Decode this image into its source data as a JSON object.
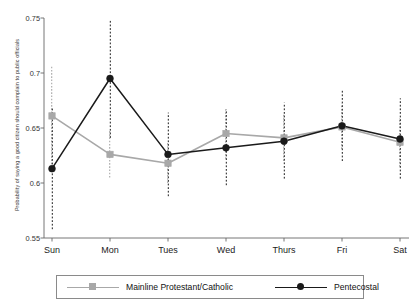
{
  "chart_data": {
    "type": "line",
    "title": "",
    "subtitle": "",
    "xlabel": "",
    "ylabel": "Probability of saying a good citizen should complain to public officials",
    "categories": [
      "Sun",
      "Mon",
      "Tues",
      "Wed",
      "Thurs",
      "Fri",
      "Sat"
    ],
    "ylim": [
      0.55,
      0.75
    ],
    "yticks": [
      0.75,
      0.7,
      0.65,
      0.6,
      0.55
    ],
    "ytick_labels": [
      "0.75",
      "0.7",
      "0.65",
      "0.6",
      "0.55"
    ],
    "grid": false,
    "legend_position": "bottom",
    "errorbars": true,
    "errorbar_style": "dotted-vertical",
    "series": [
      {
        "name": "Mainline Protestant/Catholic",
        "color": "#a8a8a8",
        "marker": "square",
        "values": [
          0.661,
          0.626,
          0.618,
          0.645,
          0.641,
          0.651,
          0.637
        ],
        "ci_low": [
          0.617,
          0.605,
          0.6,
          0.622,
          0.62,
          0.631,
          0.615
        ],
        "ci_high": [
          0.706,
          0.648,
          0.637,
          0.668,
          0.662,
          0.672,
          0.659
        ]
      },
      {
        "name": "Pentecostal",
        "color": "#1a1a1a",
        "marker": "circle",
        "values": [
          0.613,
          0.695,
          0.626,
          0.632,
          0.638,
          0.652,
          0.64
        ],
        "ci_low": [
          0.558,
          0.641,
          0.588,
          0.598,
          0.604,
          0.62,
          0.604
        ],
        "ci_high": [
          0.668,
          0.748,
          0.664,
          0.667,
          0.673,
          0.684,
          0.677
        ]
      }
    ]
  },
  "axes": {
    "y_axis_label": "Probability of saying a good citizen should complain to public officials",
    "x_axis_label": ""
  },
  "legend": {
    "items": [
      {
        "label": "Mainline Protestant/Catholic",
        "color": "#a8a8a8",
        "marker": "square"
      },
      {
        "label": "Pentecostal",
        "color": "#1a1a1a",
        "marker": "circle"
      }
    ]
  },
  "colors": {
    "series_mainline": "#a8a8a8",
    "series_pentecostal": "#1a1a1a",
    "axis": "#666666",
    "background": "#ffffff"
  }
}
